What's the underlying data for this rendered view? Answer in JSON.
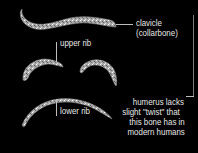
{
  "figure": {
    "background": "#000000",
    "bone_color": "#cfcfcf",
    "text_color": "#e6e6e6",
    "labels": {
      "clavicle_line1": "clavicle",
      "clavicle_line2": "(collarbone)",
      "upper_rib": "upper rib",
      "lower_rib": "lower rib",
      "humerus_line1": "humerus lacks",
      "humerus_line2": "slight \"twist\" that",
      "humerus_line3": "this bone has in",
      "humerus_line4": "modern humans"
    }
  }
}
